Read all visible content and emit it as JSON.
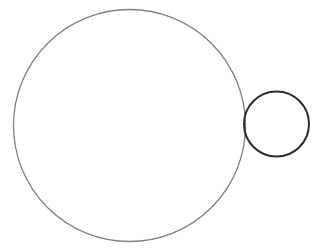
{
  "figure": {
    "canvas": {
      "width": 315,
      "height": 250,
      "background_color": "#ffffff"
    },
    "shapes": [
      {
        "name": "large-circle",
        "kind": "circle",
        "label": "Large circle",
        "cx": 129.5,
        "cy": 125.5,
        "r": 116,
        "stroke_color": "#808080",
        "stroke_width": 1.3,
        "fill": "none",
        "bounds": {
          "left": 13.5,
          "right": 245.5,
          "top": 9.5,
          "bottom": 241.5
        },
        "diameter": 232
      },
      {
        "name": "small-circle",
        "kind": "circle",
        "label": "Small circle",
        "cx": 276.5,
        "cy": 124,
        "r": 32.5,
        "stroke_color": "#2b2b2b",
        "stroke_width": 2,
        "fill": "none",
        "bounds": {
          "left": 244,
          "right": 309,
          "top": 91.5,
          "bottom": 156.5
        },
        "diameter": 65
      }
    ],
    "relationship": {
      "name": "external-tangency",
      "label": "Externally tangent",
      "tangent_point_x": 245.5,
      "tangent_point_y": 125
    }
  }
}
